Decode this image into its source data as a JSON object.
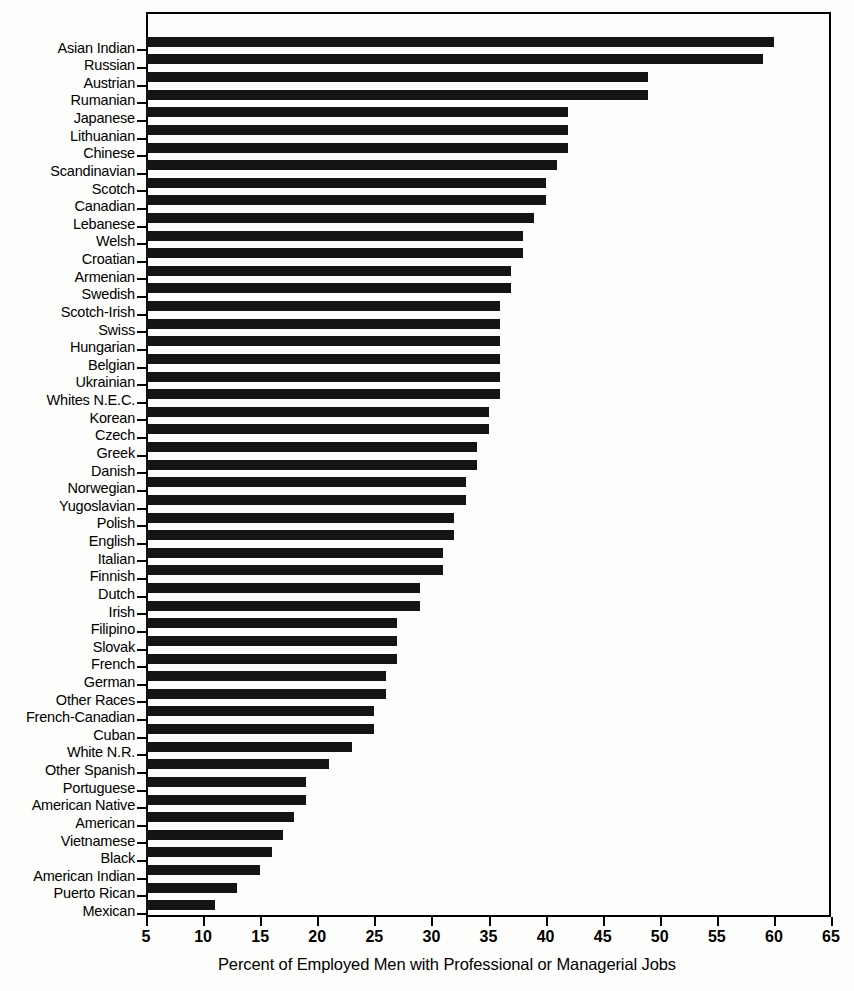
{
  "chart_data": {
    "type": "bar",
    "orientation": "horizontal",
    "title": "",
    "subtitle": "",
    "xlabel": "Percent of Employed Men with Professional or Managerial Jobs",
    "ylabel": "",
    "xlim": [
      5,
      65
    ],
    "xticks": [
      5,
      10,
      15,
      20,
      25,
      30,
      35,
      40,
      45,
      50,
      55,
      60,
      65
    ],
    "xtick_labels": [
      "5",
      "10",
      "15",
      "20",
      "25",
      "30",
      "35",
      "40",
      "45",
      "50",
      "55",
      "60",
      "65"
    ],
    "grid": false,
    "legend": null,
    "bar_color": "#141414",
    "categories": [
      "Asian Indian",
      "Russian",
      "Austrian",
      "Rumanian",
      "Japanese",
      "Lithuanian",
      "Chinese",
      "Scandinavian",
      "Scotch",
      "Canadian",
      "Lebanese",
      "Welsh",
      "Croatian",
      "Armenian",
      "Swedish",
      "Scotch-Irish",
      "Swiss",
      "Hungarian",
      "Belgian",
      "Ukrainian",
      "Whites N.E.C.",
      "Korean",
      "Czech",
      "Greek",
      "Danish",
      "Norwegian",
      "Yugoslavian",
      "Polish",
      "English",
      "Italian",
      "Finnish",
      "Dutch",
      "Irish",
      "Filipino",
      "Slovak",
      "French",
      "German",
      "Other Races",
      "French-Canadian",
      "Cuban",
      "White N.R.",
      "Other Spanish",
      "Portuguese",
      "American Native",
      "American",
      "Vietnamese",
      "Black",
      "American Indian",
      "Puerto Rican",
      "Mexican"
    ],
    "values": [
      60.0,
      59.0,
      49.0,
      49.0,
      42.0,
      42.0,
      42.0,
      41.0,
      40.0,
      40.0,
      39.0,
      38.0,
      38.0,
      37.0,
      37.0,
      36.0,
      36.0,
      36.0,
      36.0,
      36.0,
      36.0,
      35.0,
      35.0,
      34.0,
      34.0,
      33.0,
      33.0,
      32.0,
      32.0,
      31.0,
      31.0,
      29.0,
      29.0,
      27.0,
      27.0,
      27.0,
      26.0,
      26.0,
      25.0,
      25.0,
      23.0,
      21.0,
      19.0,
      19.0,
      18.0,
      17.0,
      16.0,
      15.0,
      13.0,
      11.0
    ]
  }
}
